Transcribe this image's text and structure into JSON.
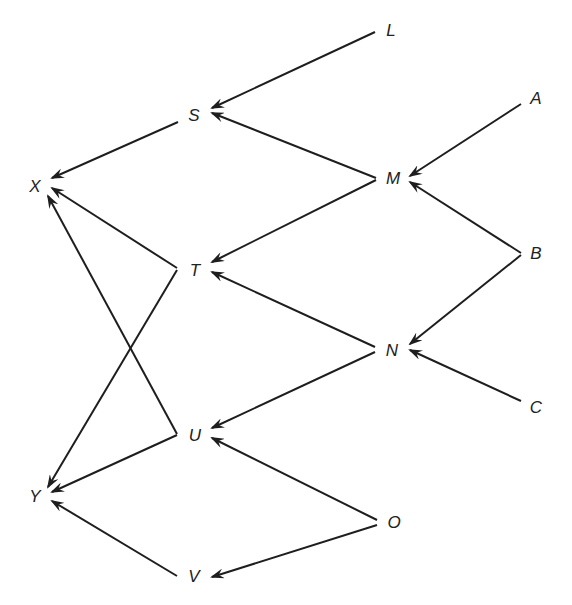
{
  "diagram": {
    "type": "directed-graph",
    "stroke_color": "#1e1e1e",
    "label_color": "#222222",
    "nodes": [
      {
        "id": "L",
        "label": "L",
        "x": 391,
        "y": 30
      },
      {
        "id": "A",
        "label": "A",
        "x": 536,
        "y": 98
      },
      {
        "id": "S",
        "label": "S",
        "x": 194,
        "y": 115
      },
      {
        "id": "M",
        "label": "M",
        "x": 393,
        "y": 178
      },
      {
        "id": "X",
        "label": "X",
        "x": 35,
        "y": 186
      },
      {
        "id": "B",
        "label": "B",
        "x": 536,
        "y": 253
      },
      {
        "id": "T",
        "label": "T",
        "x": 195,
        "y": 270
      },
      {
        "id": "N",
        "label": "N",
        "x": 392,
        "y": 350
      },
      {
        "id": "C",
        "label": "C",
        "x": 536,
        "y": 407
      },
      {
        "id": "U",
        "label": "U",
        "x": 195,
        "y": 435
      },
      {
        "id": "Y",
        "label": "Y",
        "x": 35,
        "y": 496
      },
      {
        "id": "O",
        "label": "O",
        "x": 394,
        "y": 522
      },
      {
        "id": "V",
        "label": "V",
        "x": 194,
        "y": 576
      }
    ],
    "edges": [
      {
        "from": "L",
        "to": "S",
        "x1": 375,
        "y1": 32,
        "x2": 212,
        "y2": 108
      },
      {
        "from": "M",
        "to": "S",
        "x1": 376,
        "y1": 178,
        "x2": 212,
        "y2": 113
      },
      {
        "from": "S",
        "to": "X",
        "x1": 178,
        "y1": 122,
        "x2": 52,
        "y2": 178
      },
      {
        "from": "A",
        "to": "M",
        "x1": 521,
        "y1": 104,
        "x2": 410,
        "y2": 176
      },
      {
        "from": "B",
        "to": "M",
        "x1": 521,
        "y1": 253,
        "x2": 410,
        "y2": 182
      },
      {
        "from": "M",
        "to": "T",
        "x1": 376,
        "y1": 180,
        "x2": 212,
        "y2": 262
      },
      {
        "from": "T",
        "to": "X",
        "x1": 177,
        "y1": 268,
        "x2": 52,
        "y2": 188
      },
      {
        "from": "T",
        "to": "Y",
        "x1": 177,
        "y1": 270,
        "x2": 48,
        "y2": 487
      },
      {
        "from": "U",
        "to": "X",
        "x1": 177,
        "y1": 434,
        "x2": 48,
        "y2": 196
      },
      {
        "from": "U",
        "to": "Y",
        "x1": 177,
        "y1": 435,
        "x2": 52,
        "y2": 492
      },
      {
        "from": "B",
        "to": "N",
        "x1": 521,
        "y1": 255,
        "x2": 410,
        "y2": 344
      },
      {
        "from": "C",
        "to": "N",
        "x1": 521,
        "y1": 401,
        "x2": 410,
        "y2": 350
      },
      {
        "from": "N",
        "to": "T",
        "x1": 375,
        "y1": 347,
        "x2": 212,
        "y2": 272
      },
      {
        "from": "N",
        "to": "U",
        "x1": 375,
        "y1": 352,
        "x2": 212,
        "y2": 428
      },
      {
        "from": "O",
        "to": "U",
        "x1": 377,
        "y1": 520,
        "x2": 212,
        "y2": 438
      },
      {
        "from": "O",
        "to": "V",
        "x1": 377,
        "y1": 525,
        "x2": 212,
        "y2": 577
      },
      {
        "from": "V",
        "to": "Y",
        "x1": 177,
        "y1": 576,
        "x2": 52,
        "y2": 501
      }
    ]
  }
}
